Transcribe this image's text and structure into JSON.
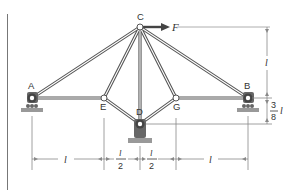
{
  "figure": {
    "type": "truss-diagram",
    "colors": {
      "member": "#555555",
      "member_core": "#ffffff",
      "support": "#666666",
      "ground": "#999999",
      "dimension": "#888888",
      "text": "#333333",
      "force_arrow": "#444444"
    },
    "nodes": [
      {
        "id": "A",
        "label": "A",
        "x": 32,
        "y": 98
      },
      {
        "id": "B",
        "label": "B",
        "x": 248,
        "y": 98
      },
      {
        "id": "C",
        "label": "C",
        "x": 140,
        "y": 27
      },
      {
        "id": "D",
        "label": "D",
        "x": 140,
        "y": 124
      },
      {
        "id": "E",
        "label": "E",
        "x": 104,
        "y": 98
      },
      {
        "id": "G",
        "label": "G",
        "x": 176,
        "y": 98
      }
    ],
    "members": [
      [
        "A",
        "C"
      ],
      [
        "A",
        "E"
      ],
      [
        "E",
        "C"
      ],
      [
        "E",
        "D"
      ],
      [
        "C",
        "D"
      ],
      [
        "C",
        "G"
      ],
      [
        "G",
        "D"
      ],
      [
        "G",
        "B"
      ],
      [
        "C",
        "B"
      ]
    ],
    "supports": [
      {
        "node": "A",
        "kind": "roller"
      },
      {
        "node": "B",
        "kind": "roller"
      },
      {
        "node": "D",
        "kind": "pin"
      }
    ],
    "load": {
      "node": "C",
      "label": "F",
      "direction": "right"
    },
    "dimensions": {
      "horizontal": [
        {
          "from": "A",
          "to": "E",
          "label_num": "l",
          "label_den": ""
        },
        {
          "from": "E",
          "to": "D",
          "label_num": "l",
          "label_den": "2"
        },
        {
          "from": "D",
          "to": "G",
          "label_num": "l",
          "label_den": "2"
        },
        {
          "from": "G",
          "to": "B",
          "label_num": "l",
          "label_den": ""
        }
      ],
      "vertical": [
        {
          "span": "C-to-AB",
          "label": "l"
        },
        {
          "span": "AB-to-D",
          "label_num": "3",
          "label_den": "8",
          "label_suffix": "l"
        }
      ]
    }
  }
}
